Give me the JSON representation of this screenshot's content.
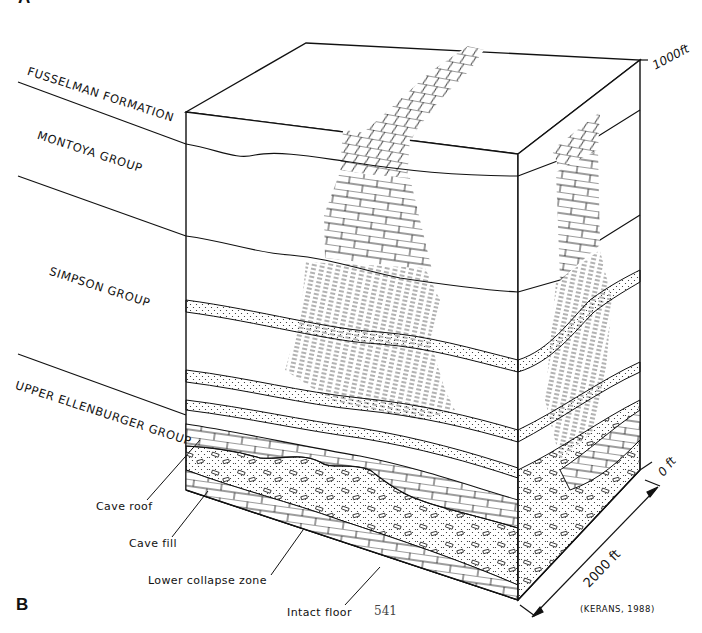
{
  "figure": {
    "panel_top_label": "A",
    "panel_label": "B",
    "credit": "(KERANS, 1988)",
    "page_number": "541"
  },
  "stratigraphic_units": [
    {
      "label": "FUSSELMAN FORMATION",
      "lithology": "cherty dolomite"
    },
    {
      "label": "MONTOYA GROUP",
      "lithology": "limestone"
    },
    {
      "label": "SIMPSON GROUP",
      "lithology": "shale with sandstone beds"
    },
    {
      "label": "UPPER ELLENBURGER GROUP",
      "lithology": "carbonate with collapsed cave system"
    }
  ],
  "callouts": [
    {
      "label": "Cave roof"
    },
    {
      "label": "Cave fill"
    },
    {
      "label": "Lower collapse zone"
    },
    {
      "label": "Intact floor"
    }
  ],
  "scale": {
    "vertical_top": "1000ft",
    "vertical_bottom": "0 ft",
    "horizontal": "2000 ft"
  },
  "colors": {
    "ink": "#111111",
    "paper": "#ffffff"
  }
}
